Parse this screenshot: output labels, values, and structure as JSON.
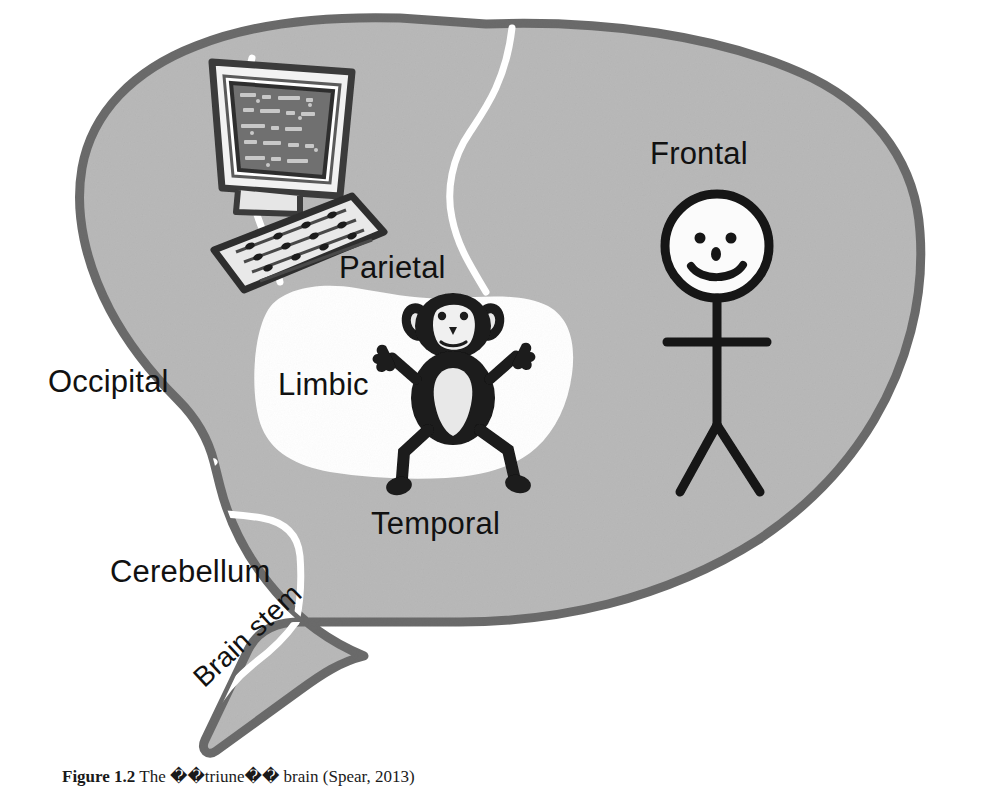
{
  "figure": {
    "kind": "triune-brain-diagram",
    "colors": {
      "page_background": "#ffffff",
      "brain_fill": "#b9b9b9",
      "brain_outline": "#6b6b6b",
      "limbic_fill": "#ffffff",
      "divider_line": "#ffffff",
      "ink": "#111111",
      "monitor_screen": "#6f6f6f",
      "monitor_bezel": "#f2f2f2",
      "keyboard_fill": "#e9e9e9",
      "monkey_body": "#1a1a1a",
      "monkey_belly": "#e8e8e8"
    }
  },
  "labels": {
    "frontal": "Frontal",
    "parietal": "Parietal",
    "occipital": "Occipital",
    "limbic": "Limbic",
    "temporal": "Temporal",
    "cerebellum": "Cerebellum",
    "brain_stem": "Brain stem"
  },
  "drawings": {
    "computer": {
      "name": "computer-illustration",
      "parts": [
        "monitor",
        "keyboard"
      ],
      "region": "parietal"
    },
    "monkey": {
      "name": "monkey-illustration",
      "region": "limbic"
    },
    "stick_figure": {
      "name": "stick-figure-illustration",
      "region": "frontal",
      "face": "smiling"
    }
  },
  "bleed_through": {
    "line_a": "the printed text is reversed",
    "line_b": "Back Cover",
    "line_c": "faint show-through of the reverse page, illegible at this resolution"
  },
  "caption": {
    "number": "Figure 1.2",
    "text": "The ��triune�� brain (Spear, 2013)"
  }
}
